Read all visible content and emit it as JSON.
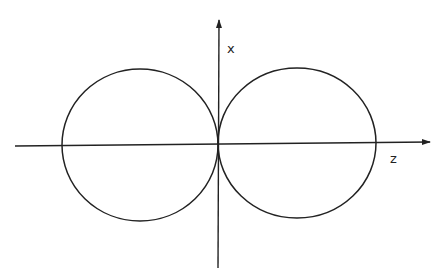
{
  "diagram": {
    "title": "",
    "axes": {
      "vertical_label": "x",
      "horizontal_label": "z"
    },
    "lobes": [
      {
        "name": "left-lobe",
        "cx": 140,
        "cy": 145,
        "rx": 78,
        "ry": 76
      },
      {
        "name": "right-lobe",
        "cx": 297,
        "cy": 143,
        "rx": 79,
        "ry": 75
      }
    ],
    "stroke_color": "#222222",
    "background": "#ffffff"
  }
}
